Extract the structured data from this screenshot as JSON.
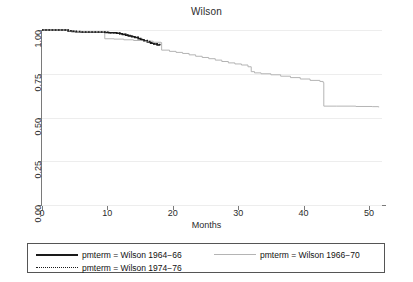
{
  "chart_data": {
    "type": "line",
    "title": "Wilson",
    "xlabel": "Months",
    "ylabel": "",
    "xlim": [
      0,
      52
    ],
    "ylim": [
      0.0,
      1.0
    ],
    "grid": true,
    "legend_position": "bottom",
    "xticks": [
      "0",
      "10",
      "20",
      "30",
      "40",
      "50"
    ],
    "xtick_values": [
      0,
      10,
      20,
      30,
      40,
      50
    ],
    "yticks": [
      "0.00",
      "0.25",
      "0.50",
      "0.75",
      "1.00"
    ],
    "ytick_values": [
      0.0,
      0.25,
      0.5,
      0.75,
      1.0
    ],
    "series": [
      {
        "name": "pmterm = Wilson 1964−66",
        "style": "solid",
        "color": "#1a1a1a",
        "x": [
          0,
          3.2,
          4.0,
          4.6,
          5.2,
          6.0,
          9.6,
          10.2,
          11.4,
          11.9,
          12.3,
          12.8,
          13.2,
          13.7,
          14.2,
          14.7,
          15.1,
          15.6,
          16.1,
          16.6,
          17.1,
          17.6,
          18.0
        ],
        "y": [
          1.0,
          1.0,
          0.995,
          0.992,
          0.99,
          0.988,
          0.986,
          0.984,
          0.982,
          0.978,
          0.975,
          0.97,
          0.966,
          0.962,
          0.957,
          0.95,
          0.944,
          0.938,
          0.932,
          0.925,
          0.92,
          0.915,
          0.912
        ]
      },
      {
        "name": "pmterm = Wilson 1966−70",
        "style": "solid",
        "color": "#b4b4b4",
        "x": [
          0,
          3.2,
          4.2,
          5.0,
          6.0,
          9.5,
          9.6,
          11.0,
          12.5,
          14.0,
          15.5,
          17.0,
          18.2,
          18.3,
          19.5,
          20.5,
          21.5,
          22.5,
          23.5,
          24.5,
          25.5,
          26.5,
          27.5,
          28.5,
          29.5,
          30.5,
          31.5,
          32.0,
          32.5,
          33.5,
          35.0,
          36.5,
          38.0,
          39.5,
          41.0,
          42.5,
          43.0,
          43.1,
          45.0,
          48.0,
          50.5,
          51.5
        ],
        "y": [
          1.0,
          1.0,
          0.995,
          0.992,
          0.99,
          0.988,
          0.95,
          0.948,
          0.944,
          0.94,
          0.936,
          0.93,
          0.928,
          0.885,
          0.878,
          0.872,
          0.866,
          0.858,
          0.85,
          0.843,
          0.836,
          0.828,
          0.82,
          0.812,
          0.806,
          0.8,
          0.79,
          0.762,
          0.755,
          0.75,
          0.744,
          0.736,
          0.728,
          0.72,
          0.712,
          0.706,
          0.7,
          0.565,
          0.565,
          0.563,
          0.562,
          0.558
        ]
      },
      {
        "name": "pmterm = Wilson 1974−76",
        "style": "dotted",
        "color": "#1a1a1a",
        "x": [
          0,
          3.2,
          4.0,
          4.6,
          5.2,
          6.0,
          9.6,
          10.2,
          11.4,
          11.9,
          12.3,
          12.8,
          13.2,
          13.7,
          14.2,
          14.7,
          15.1,
          15.6,
          16.1,
          16.6,
          17.1,
          17.6,
          18.0
        ],
        "y": [
          1.0,
          1.0,
          0.996,
          0.993,
          0.991,
          0.989,
          0.987,
          0.985,
          0.983,
          0.979,
          0.976,
          0.972,
          0.968,
          0.964,
          0.959,
          0.952,
          0.946,
          0.94,
          0.934,
          0.927,
          0.922,
          0.917,
          0.914
        ]
      }
    ]
  },
  "legend": {
    "items": [
      {
        "label": "pmterm = Wilson − 1964−66",
        "text": "pmterm = Wilson 1964−66",
        "key": "solid-black-key"
      },
      {
        "label": "pmterm = Wilson − 1966−70",
        "text": "pmterm = Wilson 1966−70",
        "key": "solid-gray-key"
      },
      {
        "label": "pmterm = Wilson − 1974−76",
        "text": "pmterm = Wilson 1974−76",
        "key": "dotted-black-key"
      }
    ]
  },
  "colors": {
    "series_black": "#1a1a1a",
    "series_gray": "#b4b4b4",
    "axis": "#7a7a7a",
    "grid": "#ededed",
    "background": "#ffffff"
  }
}
